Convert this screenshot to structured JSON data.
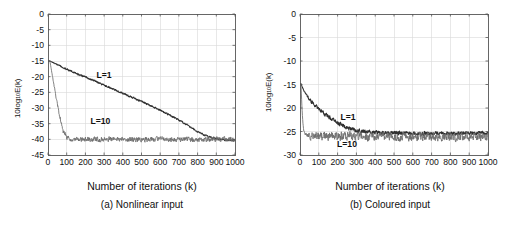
{
  "figure": {
    "background_color": "#ffffff",
    "panel_count": 2
  },
  "panels": [
    {
      "id": "a",
      "caption": "(a) Nonlinear input",
      "xlabel": "Number of iterations (k)",
      "ylabel_main": "10log",
      "ylabel_sub": "10",
      "ylabel_tail": "E(k)",
      "xticks": [
        "0",
        "100",
        "200",
        "300",
        "400",
        "500",
        "600",
        "700",
        "800",
        "900",
        "1000"
      ],
      "yticks": [
        "0",
        "-5",
        "-10",
        "-15",
        "-20",
        "-25",
        "-30",
        "-35",
        "-40",
        "-45"
      ],
      "annotations": [
        {
          "text": "L=1",
          "x": 300,
          "y": -20.3
        },
        {
          "text": "L=10",
          "x": 280,
          "y": -35.2
        }
      ]
    },
    {
      "id": "b",
      "caption": "(b) Coloured input",
      "xlabel": "Number of iterations (k)",
      "ylabel_main": "10log",
      "ylabel_sub": "10",
      "ylabel_tail": "E(k)",
      "xticks": [
        "0",
        "100",
        "200",
        "300",
        "400",
        "500",
        "600",
        "700",
        "800",
        "900",
        "1000"
      ],
      "yticks": [
        "0",
        "-5",
        "-10",
        "-15",
        "-20",
        "-25",
        "-30"
      ],
      "annotations": [
        {
          "text": "L=1",
          "x": 255,
          "y": -22.6
        },
        {
          "text": "L=10",
          "x": 250,
          "y": -28.4
        }
      ]
    }
  ],
  "chart_data": [
    {
      "type": "line",
      "panel": "a",
      "title": "(a) Nonlinear input",
      "xlabel": "Number of iterations (k)",
      "ylabel": "10log10E(k)",
      "xlim": [
        0,
        1000
      ],
      "ylim": [
        -45,
        0
      ],
      "xticks": [
        0,
        100,
        200,
        300,
        400,
        500,
        600,
        700,
        800,
        900,
        1000
      ],
      "yticks": [
        0,
        -5,
        -10,
        -15,
        -20,
        -25,
        -30,
        -35,
        -40,
        -45
      ],
      "grid": true,
      "legend": "inline-annotations",
      "series": [
        {
          "name": "L=1",
          "color": "#303030",
          "noise_amplitude_db": 0.35,
          "x": [
            10,
            50,
            100,
            150,
            200,
            250,
            300,
            350,
            400,
            450,
            500,
            550,
            600,
            650,
            700,
            750,
            800,
            850,
            900,
            950,
            1000
          ],
          "values": [
            -15.0,
            -16.2,
            -17.6,
            -18.9,
            -20.1,
            -21.4,
            -22.7,
            -24.0,
            -25.3,
            -26.6,
            -27.9,
            -29.3,
            -30.7,
            -32.2,
            -33.8,
            -35.6,
            -37.6,
            -39.0,
            -39.8,
            -40.2,
            -40.3
          ]
        },
        {
          "name": "L=10",
          "color": "#6b6b6b",
          "noise_amplitude_db": 1.1,
          "x": [
            10,
            20,
            40,
            60,
            80,
            100,
            120,
            150,
            200,
            300,
            400,
            500,
            600,
            700,
            800,
            900,
            1000
          ],
          "values": [
            -15.0,
            -18.5,
            -25.5,
            -32.0,
            -37.5,
            -39.3,
            -39.8,
            -40.0,
            -40.0,
            -40.0,
            -40.0,
            -40.0,
            -40.0,
            -40.0,
            -40.0,
            -40.0,
            -40.0
          ]
        }
      ]
    },
    {
      "type": "line",
      "panel": "b",
      "title": "(b) Coloured input",
      "xlabel": "Number of iterations (k)",
      "ylabel": "10log10E(k)",
      "xlim": [
        0,
        1000
      ],
      "ylim": [
        -30,
        0
      ],
      "xticks": [
        0,
        100,
        200,
        300,
        400,
        500,
        600,
        700,
        800,
        900,
        1000
      ],
      "yticks": [
        0,
        -5,
        -10,
        -15,
        -20,
        -25,
        -30
      ],
      "grid": true,
      "legend": "inline-annotations",
      "series": [
        {
          "name": "L=1",
          "color": "#303030",
          "noise_amplitude_db": 0.55,
          "x": [
            5,
            20,
            40,
            60,
            80,
            100,
            120,
            150,
            180,
            200,
            250,
            300,
            400,
            500,
            600,
            700,
            800,
            900,
            1000
          ],
          "values": [
            -14.8,
            -16.3,
            -17.6,
            -18.6,
            -19.4,
            -20.2,
            -20.9,
            -21.8,
            -22.6,
            -23.1,
            -24.2,
            -24.8,
            -25.2,
            -25.3,
            -25.4,
            -25.4,
            -25.4,
            -25.4,
            -25.4
          ]
        },
        {
          "name": "L=10",
          "color": "#6b6b6b",
          "noise_amplitude_db": 1.3,
          "x": [
            5,
            10,
            15,
            20,
            30,
            50,
            80,
            120,
            200,
            300,
            400,
            500,
            600,
            700,
            800,
            900,
            1000
          ],
          "values": [
            -14.8,
            -19.5,
            -23.0,
            -24.8,
            -25.6,
            -25.9,
            -26.0,
            -26.0,
            -26.0,
            -26.1,
            -26.1,
            -26.1,
            -26.1,
            -26.1,
            -26.1,
            -26.1,
            -26.1
          ]
        }
      ]
    }
  ]
}
